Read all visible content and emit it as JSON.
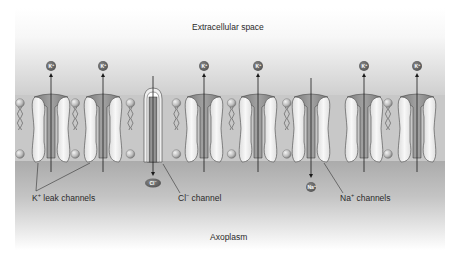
{
  "diagram": {
    "title_top": "Extracellular space",
    "title_bottom": "Axoplasm",
    "colors": {
      "panel_top": "#ffffff",
      "panel_mid": "#a9a9a9",
      "panel_bottom": "#ffffff",
      "membrane_band": "#c4c4c4",
      "lipid_head": "#b8b8b8",
      "channel_protein": "#ececec",
      "ion_circle": "#6e6e6e",
      "arrow": "#1a1a1a"
    },
    "ions_out": [
      {
        "symbol": "K",
        "charge": "+",
        "x": 51
      },
      {
        "symbol": "K",
        "charge": "+",
        "x": 103
      },
      {
        "symbol": "K",
        "charge": "+",
        "x": 204
      },
      {
        "symbol": "K",
        "charge": "+",
        "x": 258
      },
      {
        "symbol": "K",
        "charge": "+",
        "x": 364
      },
      {
        "symbol": "K",
        "charge": "+",
        "x": 417
      }
    ],
    "ions_in": [
      {
        "symbol": "Cl",
        "charge": "−",
        "x": 153
      },
      {
        "symbol": "Na",
        "charge": "+",
        "x": 311
      }
    ],
    "labels": {
      "k_leak": {
        "base": "K",
        "sup": "+",
        "rest": " leak channels"
      },
      "cl_channel": {
        "base": "Cl",
        "sup": "−",
        "rest": " channel"
      },
      "na_channels": {
        "base": "Na",
        "sup": "+",
        "rest": " channels"
      }
    }
  }
}
